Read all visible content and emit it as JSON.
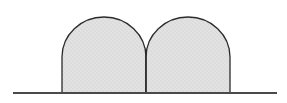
{
  "figure": {
    "canvas": {
      "width": 287,
      "height": 103,
      "background_color": "#ffffff"
    },
    "style": {
      "fill_color": "#e0e0e0",
      "stroke_color": "#2b2b2b",
      "stroke_width": 1.3,
      "baseline_color": "#4a4a4a",
      "baseline_width": 2
    },
    "baseline": {
      "label": "ground line",
      "x_start": 13,
      "x_end": 277,
      "y": 93
    },
    "shapes": [
      {
        "label": "left arch",
        "name": "arch-left",
        "x_left": 62,
        "x_right": 146,
        "y_top": 17,
        "y_spring": 57,
        "y_base": 93,
        "width": 84,
        "height": 76,
        "arc_radius": 42,
        "fill": "#e0e0e0",
        "stroke": "#2b2b2b",
        "path": "M 62 93 L 62 57 A 42 40 0 0 1 146 57 L 146 93 Z"
      },
      {
        "label": "right arch",
        "name": "arch-right",
        "x_left": 146,
        "x_right": 230,
        "y_top": 17,
        "y_spring": 57,
        "y_base": 93,
        "width": 84,
        "height": 76,
        "arc_radius": 42,
        "fill": "#e0e0e0",
        "stroke": "#2b2b2b",
        "path": "M 146 93 L 146 57 A 42 40 0 0 1 230 57 L 230 93 Z"
      }
    ],
    "divider": {
      "label": "shared center edge",
      "x": 146,
      "y_top": 50,
      "y_bottom": 93
    },
    "cusp": {
      "label": "cusp where arches meet",
      "x": 146,
      "y": 50
    }
  }
}
